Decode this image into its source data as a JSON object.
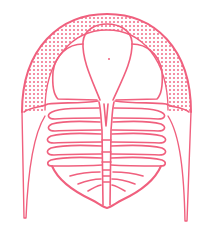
{
  "figure": {
    "stroke_color": "#f0607e",
    "background": "#ffffff",
    "parts": [
      "cephalon",
      "glabella",
      "left-cheek",
      "right-cheek",
      "dotted-border",
      "genal-spine-left",
      "genal-spine-right",
      "thorax",
      "axial-lobe",
      "pygidium"
    ]
  }
}
